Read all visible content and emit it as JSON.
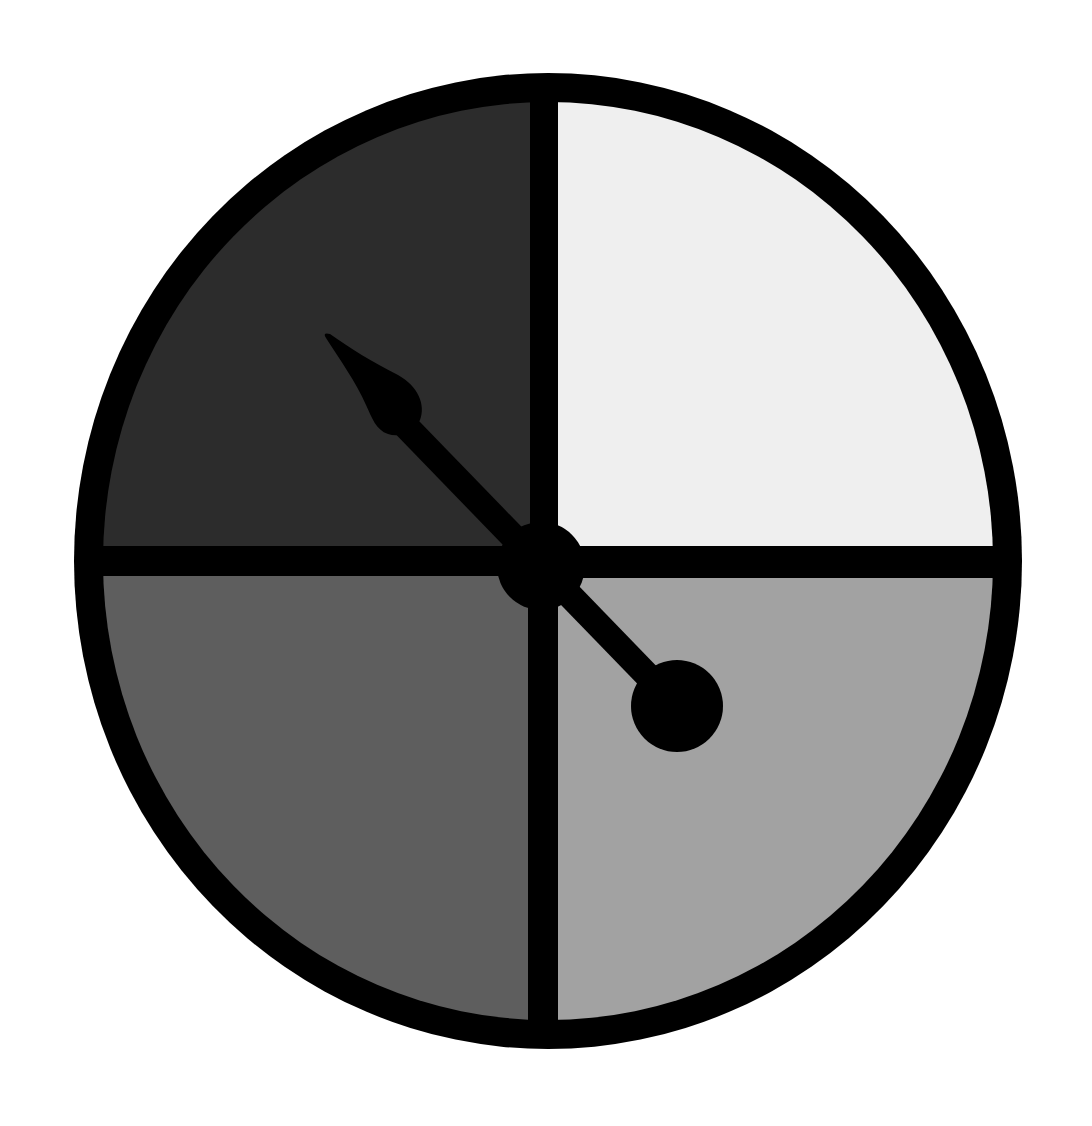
{
  "figure": {
    "title": "Four-section spinner with arrow",
    "type": "spinner",
    "background": "#ffffff",
    "outline_color": "#000000",
    "sections": [
      {
        "id": "top-left",
        "label": "dark gray section",
        "color": "#2c2c2c"
      },
      {
        "id": "top-right",
        "label": "light gray section",
        "color": "#efefef"
      },
      {
        "id": "bottom-left",
        "label": "medium gray section",
        "color": "#5e5e5e"
      },
      {
        "id": "bottom-right",
        "label": "light-medium gray section",
        "color": "#a2a2a2"
      }
    ],
    "pointer": {
      "color": "#000000",
      "points_to": "top-left"
    }
  }
}
